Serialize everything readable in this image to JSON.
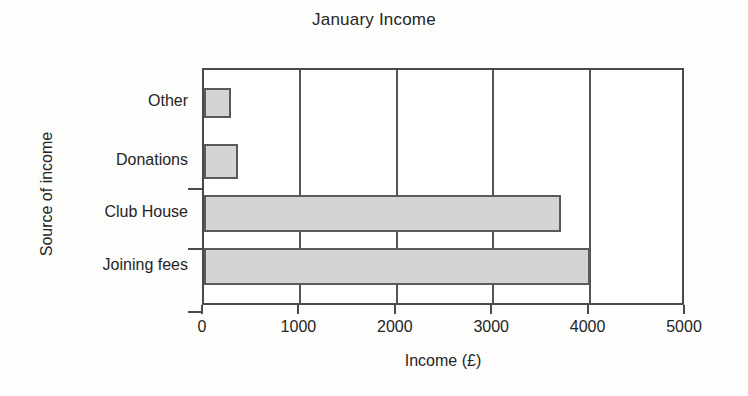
{
  "chart_data": {
    "type": "bar",
    "orientation": "horizontal",
    "title": "January Income",
    "xlabel": "Income (£)",
    "ylabel": "Source of income",
    "categories": [
      "Other",
      "Donations",
      "Club House",
      "Joining fees"
    ],
    "values": [
      280,
      350,
      3700,
      4000
    ],
    "xlim": [
      0,
      5000
    ],
    "xticks": [
      0,
      1000,
      2000,
      3000,
      4000,
      5000
    ],
    "xtick_labels": [
      "0",
      "1000",
      "2000",
      "3000",
      "4000",
      "5000"
    ],
    "grid": true,
    "grid_axis": "x",
    "legend": false,
    "bar_fill_color": "#d4d4d4",
    "bar_edge_color": "#5a5a5a",
    "axis_color": "#4a4a4a",
    "background_color": "#ffffff"
  },
  "bars": [
    {
      "label": "Other",
      "value": 280,
      "top": 18,
      "height": 30
    },
    {
      "label": "Donations",
      "value": 350,
      "top": 74,
      "height": 35
    },
    {
      "label": "Club House",
      "value": 3700,
      "top": 125,
      "height": 37
    },
    {
      "label": "Joining fees",
      "value": 4000,
      "top": 178,
      "height": 37
    }
  ],
  "ytick_marks": [
    {
      "top": 120
    },
    {
      "top": 180
    },
    {
      "top": 243
    }
  ]
}
